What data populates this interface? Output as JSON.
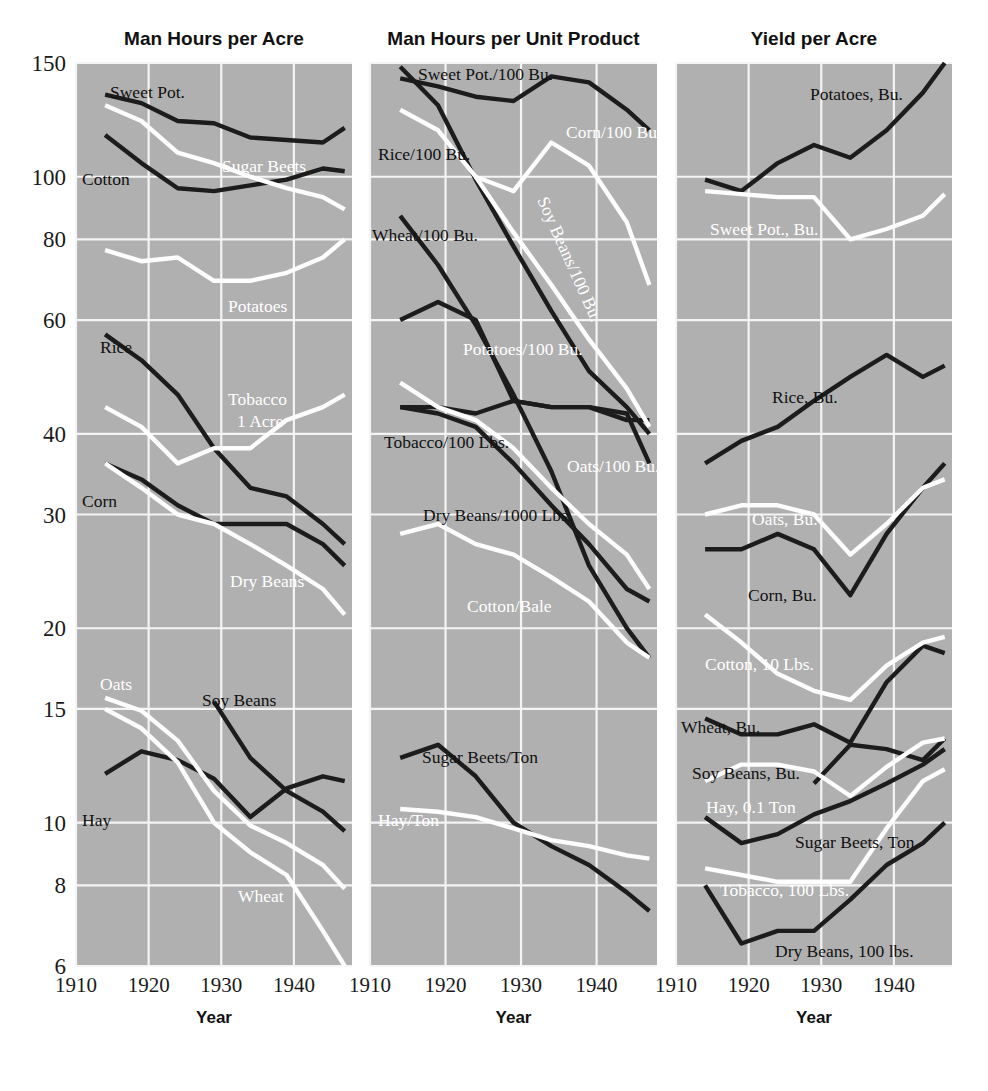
{
  "figure": {
    "width": 988,
    "height": 1091,
    "background": "#ffffff",
    "plot_background": "#b0b0b0",
    "grid_color": "#f4f4f4",
    "dark_series_color": "#1c1c1c",
    "light_series_color": "#fdfdfd"
  },
  "axis": {
    "x_label": "Year",
    "x_ticks": [
      "1910",
      "1920",
      "1930",
      "1940"
    ],
    "x_tick_values": [
      1910,
      1920,
      1930,
      1940
    ],
    "x_range": [
      1910,
      1948
    ],
    "y_ticks": [
      "150",
      "100",
      "80",
      "60",
      "40",
      "30",
      "20",
      "15",
      "10",
      "8",
      "6"
    ],
    "y_tick_values": [
      150,
      100,
      80,
      60,
      40,
      30,
      20,
      15,
      10,
      8,
      6
    ],
    "y_scale": "log",
    "y_range": [
      6,
      150
    ],
    "grid": true,
    "legend": "inline-labels"
  },
  "panels": [
    {
      "id": "man-hours-per-acre",
      "title": "Man Hours per Acre"
    },
    {
      "id": "man-hours-per-unit-product",
      "title": "Man Hours per Unit Product"
    },
    {
      "id": "yield-per-acre",
      "title": "Yield per Acre"
    }
  ],
  "chart_data": [
    {
      "type": "line",
      "title": "Man Hours per Acre",
      "xlabel": "Year",
      "ylabel": "",
      "ylim": [
        6,
        150
      ],
      "xlim": [
        1910,
        1948
      ],
      "yscale": "log",
      "grid": true,
      "legend": "inline-labels",
      "x": [
        1914,
        1919,
        1924,
        1929,
        1934,
        1939,
        1944,
        1947
      ],
      "series": [
        {
          "name": "Sweet Pot.",
          "color": "dark",
          "label": "Sweet Pot.",
          "values": [
            134,
            130,
            122,
            121,
            115,
            114,
            113,
            119
          ]
        },
        {
          "name": "Sugar Beets",
          "color": "light",
          "label": "Sugar Beets",
          "values": [
            129,
            122,
            109,
            105,
            100,
            96,
            93,
            89
          ]
        },
        {
          "name": "Cotton",
          "color": "dark",
          "label": "Cotton",
          "values": [
            116,
            105,
            96,
            95,
            97,
            99,
            103,
            102
          ]
        },
        {
          "name": "Potatoes",
          "color": "light",
          "label": "Potatoes",
          "values": [
            77,
            74,
            75,
            69,
            69,
            71,
            75,
            80
          ]
        },
        {
          "name": "Rice",
          "color": "dark",
          "label": "Rice",
          "values": [
            57,
            52,
            46,
            38,
            33,
            32,
            29,
            27
          ]
        },
        {
          "name": "Tobacco 1 Acre",
          "color": "light",
          "label": "Tobacco 1 Acre",
          "values": [
            44,
            41,
            36,
            38,
            38,
            42,
            44,
            46
          ]
        },
        {
          "name": "Corn",
          "color": "dark",
          "label": "Corn",
          "values": [
            36,
            34,
            31,
            29,
            29,
            29,
            27,
            25
          ]
        },
        {
          "name": "Dry Beans",
          "color": "light",
          "label": "Dry Beans",
          "values": [
            36,
            33,
            30,
            29,
            27,
            25,
            23,
            21
          ]
        },
        {
          "name": "Oats",
          "color": "light",
          "label": "Oats",
          "values": [
            15.6,
            14.9,
            13.4,
            11.2,
            9.9,
            9.3,
            8.6,
            7.9
          ]
        },
        {
          "name": "Soy Beans",
          "color": "dark",
          "label": "Soy Beans",
          "values": [
            15.4,
            12.6,
            11.2,
            10.4,
            9.7
          ]
        },
        {
          "name": "Hay",
          "color": "dark",
          "label": "Hay",
          "values": [
            11.9,
            12.9,
            12.5,
            11.7,
            10.2,
            11.3,
            11.8,
            11.6
          ]
        },
        {
          "name": "Wheat",
          "color": "light",
          "label": "Wheat",
          "values": [
            15.0,
            14.0,
            12.4,
            10.0,
            9.0,
            8.3,
            6.8,
            6.0
          ]
        }
      ]
    },
    {
      "type": "line",
      "title": "Man Hours per Unit Product",
      "xlabel": "Year",
      "ylabel": "",
      "ylim": [
        6,
        150
      ],
      "xlim": [
        1910,
        1948
      ],
      "yscale": "log",
      "grid": true,
      "legend": "inline-labels",
      "x": [
        1914,
        1919,
        1924,
        1929,
        1934,
        1939,
        1944,
        1947
      ],
      "series": [
        {
          "name": "Sweet Pot./100 Bu.",
          "color": "dark",
          "label": "Sweet Pot./100 Bu.",
          "values": [
            142,
            138,
            133,
            131,
            143,
            140,
            127,
            118
          ]
        },
        {
          "name": "Rice/100 Bu.",
          "color": "dark",
          "label": "Rice/100 Bu.",
          "values": [
            148,
            129,
            99,
            78,
            62,
            50,
            44,
            40
          ]
        },
        {
          "name": "Corn/100 Bu.",
          "color": "light",
          "label": "Corn/100 Bu.",
          "values": [
            127,
            118,
            100,
            95,
            113,
            104,
            85,
            68
          ]
        },
        {
          "name": "Soy Beans/100 Bu.",
          "color": "light",
          "label": "Soy Beans/100 Bu.",
          "values": [
            100,
            82,
            68,
            56,
            47,
            41
          ]
        },
        {
          "name": "Wheat/100 Bu.",
          "color": "dark",
          "label": "Wheat/100 Bu.",
          "values": [
            87,
            73,
            59,
            46,
            35,
            25,
            20,
            18
          ]
        },
        {
          "name": "Potatoes/100 Bu.",
          "color": "dark",
          "label": "Potatoes/100 Bu.",
          "values": [
            60,
            64,
            60,
            45,
            44,
            44,
            43,
            36
          ]
        },
        {
          "name": "Tobacco/100 Lbs.",
          "color": "dark",
          "label": "Tobacco/100 Lbs.",
          "values": [
            44,
            44,
            43,
            45,
            44,
            44,
            42,
            42
          ]
        },
        {
          "name": "Oats/100 Bu.",
          "color": "light",
          "label": "Oats/100 Bu.",
          "values": [
            48,
            44,
            42,
            38,
            33,
            29,
            26,
            23
          ]
        },
        {
          "name": "Dry Beans/1000 Lbs.",
          "color": "dark",
          "label": "Dry Beans/1000 Lbs.",
          "values": [
            44,
            43,
            41,
            36,
            31,
            27,
            23,
            22
          ]
        },
        {
          "name": "Cotton/Bale",
          "color": "light",
          "label": "Cotton/Bale",
          "values": [
            28,
            29,
            27,
            26,
            24,
            22,
            19,
            18
          ]
        },
        {
          "name": "Sugar Beets/Ton",
          "color": "dark",
          "label": "Sugar Beets/Ton",
          "values": [
            12.6,
            13.2,
            11.8,
            10.0,
            9.2,
            8.6,
            7.8,
            7.3
          ]
        },
        {
          "name": "Hay/Ton",
          "color": "light",
          "label": "Hay/Ton",
          "values": [
            10.5,
            10.4,
            10.2,
            9.8,
            9.4,
            9.2,
            8.9,
            8.8
          ]
        }
      ]
    },
    {
      "type": "line",
      "title": "Yield per Acre",
      "xlabel": "Year",
      "ylabel": "",
      "ylim": [
        6,
        150
      ],
      "xlim": [
        1910,
        1948
      ],
      "yscale": "log",
      "grid": true,
      "legend": "inline-labels",
      "x": [
        1914,
        1919,
        1924,
        1929,
        1934,
        1939,
        1944,
        1947
      ],
      "series": [
        {
          "name": "Potatoes, Bu.",
          "color": "dark",
          "label": "Potatoes, Bu.",
          "values": [
            99,
            95,
            105,
            112,
            107,
            118,
            135,
            150
          ]
        },
        {
          "name": "Sweet Pot., Bu.",
          "color": "light",
          "label": "Sweet Pot., Bu.",
          "values": [
            95,
            94,
            93,
            93,
            80,
            83,
            87,
            94
          ]
        },
        {
          "name": "Rice, Bu.",
          "color": "dark",
          "label": "Rice, Bu.",
          "values": [
            36,
            39,
            41,
            45,
            49,
            53,
            49,
            51
          ]
        },
        {
          "name": "Oats, Bu.",
          "color": "light",
          "label": "Oats, Bu.",
          "values": [
            30,
            31,
            31,
            30,
            26,
            29,
            33,
            34
          ]
        },
        {
          "name": "Corn, Bu.",
          "color": "dark",
          "label": "Corn, Bu.",
          "values": [
            26.5,
            26.5,
            28,
            26.5,
            22.5,
            28,
            33,
            36
          ]
        },
        {
          "name": "Cotton, 10 Lbs.",
          "color": "light",
          "label": "Cotton, 10 Lbs.",
          "values": [
            21,
            19,
            17,
            16,
            15.5,
            17.5,
            19,
            19.4
          ]
        },
        {
          "name": "Wheat, Bu.",
          "color": "dark",
          "label": "Wheat, Bu.",
          "values": [
            14.5,
            13.7,
            13.7,
            14.2,
            13.3,
            16.5,
            18.8,
            18.3
          ]
        },
        {
          "name": "Soy Beans, Bu.",
          "color": "dark",
          "label": "Soy Beans, Bu.",
          "values": [
            11.5,
            13.2,
            13.0,
            12.5,
            13.5
          ]
        },
        {
          "name": "Hay, 0.1 Ton",
          "color": "light",
          "label": "Hay, 0.1 Ton",
          "values": [
            11.6,
            12.3,
            12.3,
            12.0,
            11.0,
            12.2,
            13.3,
            13.5
          ]
        },
        {
          "name": "Sugar Beets, Ton",
          "color": "dark",
          "label": "Sugar Beets, Ton",
          "values": [
            10.2,
            9.3,
            9.6,
            10.3,
            10.8,
            11.5,
            12.3,
            13.0
          ]
        },
        {
          "name": "Tobacco, 100 Lbs.",
          "color": "light",
          "label": "Tobacco, 100 Lbs.",
          "values": [
            8.5,
            8.3,
            8.1,
            8.1,
            8.1,
            9.8,
            11.6,
            12.1
          ]
        },
        {
          "name": "Dry Beans, 100 lbs.",
          "color": "dark",
          "label": "Dry Beans, 100 lbs.",
          "values": [
            8.0,
            6.5,
            6.8,
            6.8,
            7.6,
            8.6,
            9.3,
            10.0
          ]
        }
      ]
    }
  ],
  "annotations": {
    "panel1": [
      {
        "text": "Sweet Pot.",
        "tone": "dark",
        "x": 110,
        "y": 98
      },
      {
        "text": "Cotton",
        "tone": "dark",
        "x": 82,
        "y": 185
      },
      {
        "text": "Sugar Beets",
        "tone": "light",
        "x": 222,
        "y": 172
      },
      {
        "text": "Potatoes",
        "tone": "light",
        "x": 228,
        "y": 312
      },
      {
        "text": "Rice",
        "tone": "dark",
        "x": 100,
        "y": 353
      },
      {
        "text": "Tobacco",
        "tone": "light",
        "x": 228,
        "y": 405
      },
      {
        "text": "1 Acre",
        "tone": "light",
        "x": 237,
        "y": 427
      },
      {
        "text": "Corn",
        "tone": "dark",
        "x": 82,
        "y": 507
      },
      {
        "text": "Dry Beans",
        "tone": "light",
        "x": 230,
        "y": 587
      },
      {
        "text": "Oats",
        "tone": "light",
        "x": 100,
        "y": 690
      },
      {
        "text": "Soy Beans",
        "tone": "dark",
        "x": 202,
        "y": 706
      },
      {
        "text": "Hay",
        "tone": "dark",
        "x": 82,
        "y": 826
      },
      {
        "text": "Wheat",
        "tone": "light",
        "x": 238,
        "y": 902
      }
    ],
    "panel2": [
      {
        "text": "Sweet Pot./100 Bu.",
        "tone": "dark",
        "x": 418,
        "y": 80
      },
      {
        "text": "Rice/100 Bu.",
        "tone": "dark",
        "x": 378,
        "y": 160
      },
      {
        "text": "Corn/100 Bu.",
        "tone": "light",
        "x": 566,
        "y": 138
      },
      {
        "text": "Wheat/100 Bu.",
        "tone": "dark",
        "x": 372,
        "y": 241
      },
      {
        "text": "Potatoes/100 Bu.",
        "tone": "light",
        "x": 463,
        "y": 355
      },
      {
        "text": "Tobacco/100 Lbs.",
        "tone": "dark",
        "x": 384,
        "y": 448
      },
      {
        "text": "Oats/100 Bu.",
        "tone": "light",
        "x": 567,
        "y": 472
      },
      {
        "text": "Dry Beans/1000 Lbs.",
        "tone": "dark",
        "x": 423,
        "y": 521
      },
      {
        "text": "Cotton/Bale",
        "tone": "light",
        "x": 467,
        "y": 612
      },
      {
        "text": "Sugar Beets/Ton",
        "tone": "dark",
        "x": 422,
        "y": 763
      },
      {
        "text": "Hay/Ton",
        "tone": "light",
        "x": 378,
        "y": 826
      },
      {
        "text": "Soy Beans/100 Bu.",
        "tone": "light",
        "rotate": true,
        "x": 537,
        "y": 200
      }
    ],
    "panel3": [
      {
        "text": "Potatoes, Bu.",
        "tone": "dark",
        "x": 810,
        "y": 100
      },
      {
        "text": "Sweet Pot., Bu.",
        "tone": "light",
        "x": 710,
        "y": 235
      },
      {
        "text": "Rice, Bu.",
        "tone": "dark",
        "x": 772,
        "y": 403
      },
      {
        "text": "Oats, Bu.",
        "tone": "light",
        "x": 752,
        "y": 525
      },
      {
        "text": "Corn, Bu.",
        "tone": "dark",
        "x": 748,
        "y": 601
      },
      {
        "text": "Cotton, 10 Lbs.",
        "tone": "light",
        "x": 705,
        "y": 670
      },
      {
        "text": "Wheat, Bu.",
        "tone": "dark",
        "x": 681,
        "y": 733
      },
      {
        "text": "Soy Beans, Bu.",
        "tone": "dark",
        "x": 692,
        "y": 779
      },
      {
        "text": "Hay, 0.1 Ton",
        "tone": "light",
        "x": 706,
        "y": 813
      },
      {
        "text": "Sugar Beets, Ton",
        "tone": "dark",
        "x": 795,
        "y": 848
      },
      {
        "text": "Tobacco, 100 Lbs.",
        "tone": "light",
        "x": 720,
        "y": 896
      },
      {
        "text": "Dry Beans, 100 lbs.",
        "tone": "dark",
        "x": 775,
        "y": 957
      }
    ]
  }
}
